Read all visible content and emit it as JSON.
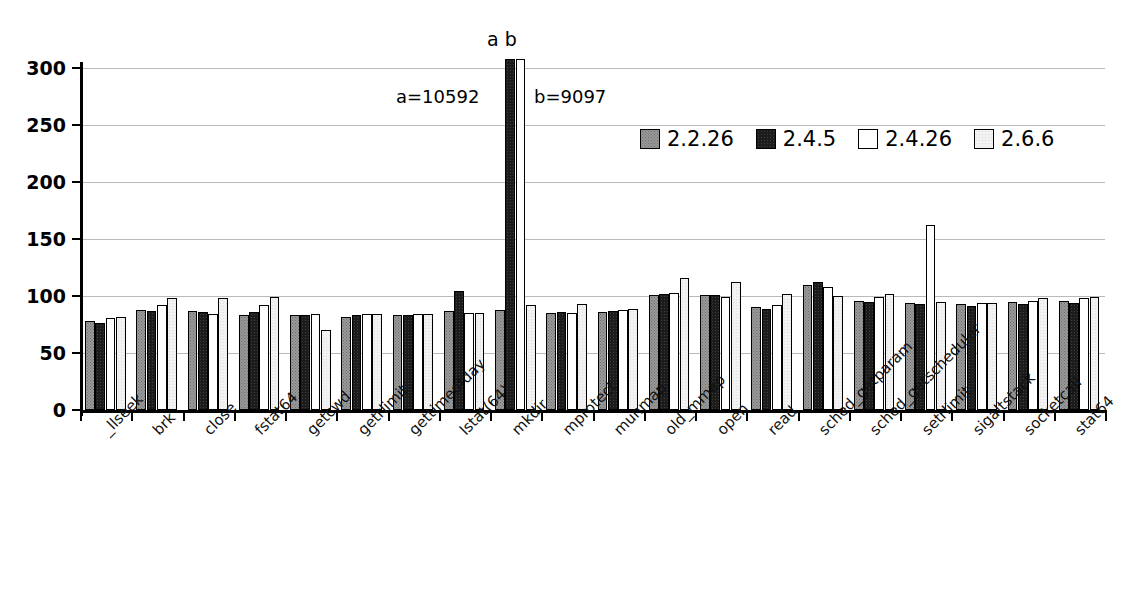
{
  "chart_data": {
    "type": "bar",
    "title": "",
    "xlabel": "",
    "ylabel": "",
    "ylim": [
      0,
      300
    ],
    "yticks": [
      0,
      50,
      100,
      150,
      200,
      250,
      300
    ],
    "grid": true,
    "legend_position": "top-right",
    "categories": [
      "_llseek",
      "brk",
      "close",
      "fstat64",
      "getcwd",
      "getrlimit",
      "gettimeofday",
      "lstat(64)",
      "mkdir",
      "mprotect",
      "munmap",
      "old_mmap",
      "open",
      "read",
      "sched_getparam",
      "sched_getscheduler",
      "setrlimit",
      "sigaltstack",
      "socketcall",
      "stat64"
    ],
    "series": [
      {
        "name": "2.2.26",
        "color": "#9a9a9a",
        "values": [
          78,
          88,
          87,
          83,
          83,
          82,
          83,
          87,
          88,
          85,
          86,
          101,
          101,
          90,
          110,
          96,
          94,
          93,
          95,
          96
        ]
      },
      {
        "name": "2.4.5",
        "color": "#1c1c1c",
        "values": [
          76,
          87,
          86,
          86,
          83,
          83,
          83,
          104,
          10592,
          86,
          87,
          102,
          101,
          89,
          112,
          95,
          93,
          91,
          93,
          94
        ]
      },
      {
        "name": "2.4.26",
        "color": "#ffffff",
        "values": [
          81,
          92,
          84,
          92,
          84,
          84,
          84,
          85,
          9097,
          85,
          88,
          103,
          99,
          92,
          108,
          99,
          162,
          94,
          96,
          98
        ]
      },
      {
        "name": "2.6.6",
        "color": "#f2f2f2",
        "values": [
          82,
          98,
          98,
          99,
          70,
          84,
          84,
          85,
          92,
          93,
          89,
          116,
          112,
          102,
          100,
          102,
          95,
          94,
          98,
          99
        ]
      }
    ],
    "annotations": [
      {
        "name": "clipped-marker",
        "text": "a  b"
      },
      {
        "name": "value-a",
        "text": "a=10592"
      },
      {
        "name": "value-b",
        "text": "b=9097"
      }
    ],
    "clipped": {
      "a": 10592,
      "b": 9097
    }
  },
  "legend": {
    "items": [
      {
        "label": "2.2.26",
        "swatch": "series-0-swatch"
      },
      {
        "label": "2.4.5",
        "swatch": "series-1-swatch"
      },
      {
        "label": "2.4.26",
        "swatch": "series-2-swatch"
      },
      {
        "label": "2.6.6",
        "swatch": "series-3-swatch"
      }
    ]
  },
  "axis": {
    "y_tick_labels": [
      "300",
      "250",
      "200",
      "150",
      "100",
      "50",
      "0"
    ]
  }
}
